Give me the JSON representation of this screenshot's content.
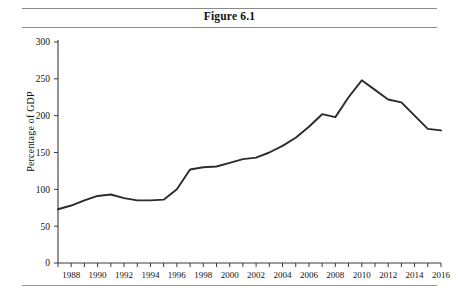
{
  "figure": {
    "title": "Figure 6.1"
  },
  "chart_data": {
    "type": "line",
    "title": "Figure 6.1",
    "xlabel": "",
    "ylabel": "Percentage of GDP",
    "xlim": [
      1987,
      2016
    ],
    "ylim": [
      0,
      300
    ],
    "grid": false,
    "legend": null,
    "y_ticks": [
      0,
      50,
      100,
      150,
      200,
      250,
      300
    ],
    "y_tick_labels": [
      "0",
      "50",
      "100",
      "150",
      "200",
      "250",
      "300"
    ],
    "x_ticks": [
      1987,
      1988,
      1989,
      1990,
      1991,
      1992,
      1993,
      1994,
      1995,
      1996,
      1997,
      1998,
      1999,
      2000,
      2001,
      2002,
      2003,
      2004,
      2005,
      2006,
      2007,
      2008,
      2009,
      2010,
      2011,
      2012,
      2013,
      2014,
      2015,
      2016
    ],
    "x_tick_labels_shown": [
      "1988",
      "1990",
      "1992",
      "1994",
      "1996",
      "1998",
      "2000",
      "2002",
      "2004",
      "2006",
      "2008",
      "2010",
      "2012",
      "2014",
      "2016"
    ],
    "x_labeled_years": [
      1988,
      1990,
      1992,
      1994,
      1996,
      1998,
      2000,
      2002,
      2004,
      2006,
      2008,
      2010,
      2012,
      2014,
      2016
    ],
    "series": [
      {
        "name": "Percentage of GDP",
        "color": "#2b2b2b",
        "x": [
          1987,
          1988,
          1989,
          1990,
          1991,
          1992,
          1993,
          1994,
          1995,
          1996,
          1997,
          1998,
          1999,
          2000,
          2001,
          2002,
          2003,
          2004,
          2005,
          2006,
          2007,
          2008,
          2009,
          2010,
          2011,
          2012,
          2013,
          2014,
          2015,
          2016
        ],
        "values": [
          73,
          78,
          85,
          91,
          93,
          88,
          85,
          85,
          86,
          100,
          127,
          130,
          131,
          136,
          141,
          143,
          150,
          159,
          170,
          185,
          202,
          198,
          225,
          248,
          235,
          222,
          218,
          200,
          182,
          180
        ]
      }
    ]
  },
  "axis": {
    "y_title": "Percentage of GDP"
  }
}
